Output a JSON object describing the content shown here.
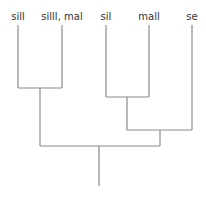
{
  "diagram": {
    "type": "tree",
    "leaves": [
      {
        "id": "l1",
        "label": "sill",
        "x": 18
      },
      {
        "id": "l2",
        "label": "silll, mal",
        "x": 62
      },
      {
        "id": "l3",
        "label": "sil",
        "x": 106
      },
      {
        "id": "l4",
        "label": "mall",
        "x": 149
      },
      {
        "id": "l5",
        "label": "se",
        "x": 192
      }
    ],
    "nodes": [
      {
        "id": "n1",
        "children": [
          "l1",
          "l2"
        ],
        "y": 88
      },
      {
        "id": "n2",
        "children": [
          "l3",
          "l4"
        ],
        "y": 97
      },
      {
        "id": "n3",
        "children": [
          "n2",
          "l5"
        ],
        "y": 130
      },
      {
        "id": "root",
        "children": [
          "n1",
          "n3"
        ],
        "y": 146
      }
    ],
    "edge_color": "#8a8a8a",
    "label_color": "#333333"
  }
}
